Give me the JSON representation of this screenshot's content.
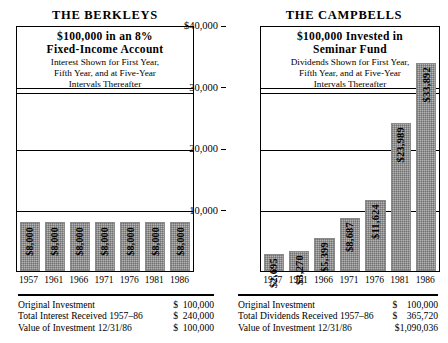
{
  "chart_data": [
    {
      "type": "bar",
      "panel": "left",
      "title": "THE BERKLEYS",
      "caption_line1": "$100,000 in an 8%",
      "caption_line2": "Fixed-Income  Account",
      "caption_sub1": "Interest Shown for First Year,",
      "caption_sub2": "Fifth Year, and at Five-Year",
      "caption_sub3": "Intervals Thereafter",
      "categories": [
        "1957",
        "1961",
        "1966",
        "1971",
        "1976",
        "1981",
        "1986"
      ],
      "values": [
        8000,
        8000,
        8000,
        8000,
        8000,
        8000,
        8000
      ],
      "labels": [
        "$8,000",
        "$8,000",
        "$8,000",
        "$8,000",
        "$8,000",
        "$8,000",
        "$8,000"
      ],
      "ylim": [
        0,
        40000
      ],
      "yticks": [
        10000,
        20000,
        30000,
        40000
      ],
      "ytick_labels": [
        "10,000",
        "20,000",
        "30,000",
        "$40,000"
      ],
      "xlabel": "",
      "ylabel": "",
      "grid": true,
      "legend": "none",
      "bar_color": "#b4b4b4"
    },
    {
      "type": "bar",
      "panel": "right",
      "title": "THE CAMPBELLS",
      "caption_line1": "$100,000  Invested  in",
      "caption_line2": "Seminar  Fund",
      "caption_sub1": "Dividends Shown for First Year,",
      "caption_sub2": "Fifth Year, and at Five-Year",
      "caption_sub3": "Intervals Thereafter",
      "categories": [
        "1957",
        "1961",
        "1966",
        "1971",
        "1976",
        "1981",
        "1986"
      ],
      "values": [
        2695,
        3270,
        5399,
        8687,
        11624,
        23989,
        33892
      ],
      "labels": [
        "$2,695",
        "$3,270",
        "$5,399",
        "$8,687",
        "$11,624",
        "$23,989",
        "$33,892"
      ],
      "ylim": [
        0,
        40000
      ],
      "yticks": [
        10000,
        20000,
        30000,
        40000
      ],
      "ytick_labels": [
        "10,000",
        "20,000",
        "30,000",
        "$40,000"
      ],
      "xlabel": "",
      "ylabel": "",
      "grid": true,
      "legend": "none",
      "bar_color": "#b4b4b4"
    }
  ],
  "left_panel": {
    "title": "THE BERKLEYS",
    "caption": {
      "line1": "$100,000 in an 8%",
      "line2": "Fixed-Income  Account",
      "sub1": "Interest Shown for First Year,",
      "sub2": "Fifth Year, and at Five-Year",
      "sub3": "Intervals Thereafter"
    },
    "summary": {
      "rows": [
        {
          "label": "Original Investment",
          "value": "$  100,000"
        },
        {
          "label": "Total Interest Received 1957–86",
          "value": "$  240,000"
        },
        {
          "label": "Value of Investment 12/31/86",
          "value": "$  100,000"
        }
      ]
    }
  },
  "right_panel": {
    "title": "THE CAMPBELLS",
    "caption": {
      "line1": "$100,000  Invested  in",
      "line2": "Seminar  Fund",
      "sub1": "Dividends Shown for First Year,",
      "sub2": "Fifth Year, and at Five-Year",
      "sub3": "Intervals Thereafter"
    },
    "summary": {
      "rows": [
        {
          "label": "Original Investment",
          "value": "$    100,000"
        },
        {
          "label": "Total Dividends Received 1957–86",
          "value": "$    365,720"
        },
        {
          "label": "Value of Investment 12/31/86",
          "value": "$1,090,036"
        }
      ]
    }
  }
}
